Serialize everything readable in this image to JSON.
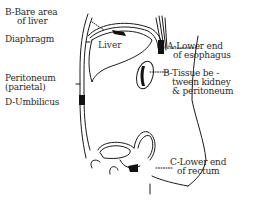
{
  "diagram": {
    "type": "anatomical sagittal section sketch",
    "colors": {
      "ink": "#1a1a1a",
      "background": "#ffffff"
    },
    "organ_label": "Liver",
    "labels": {
      "bare_area_line1": "B-Bare area",
      "bare_area_line2": "of liver",
      "diaphragm": "Diaphragm",
      "peritoneum_line1": "Peritoneum",
      "peritoneum_line2": "(parietal)",
      "umbilicus": "D-Umbilicus",
      "esophagus_line1": "A-Lower end",
      "esophagus_line2": "of esophagus",
      "kidney_line1": "B-Tissue be -",
      "kidney_line2": "tween kidney",
      "kidney_line3": "& peritoneum",
      "rectum_line1": "C-Lower end",
      "rectum_line2": "of rectum"
    }
  }
}
